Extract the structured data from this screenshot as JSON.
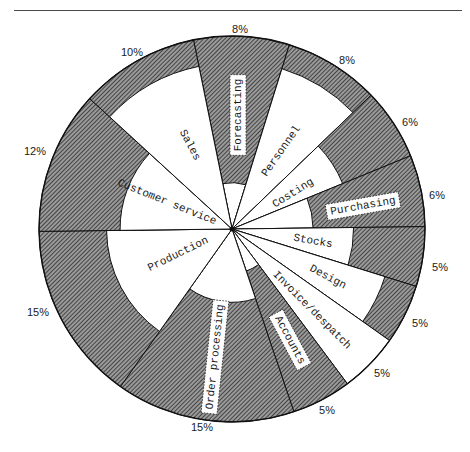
{
  "chart_data": {
    "type": "pie",
    "title": "",
    "categories": [
      "Forecasting",
      "Personnel",
      "Costing",
      "Purchasing",
      "Stocks",
      "Design",
      "Invoice/despatch",
      "Accounts",
      "Order processing",
      "Production",
      "Customer service",
      "Sales"
    ],
    "values": [
      8,
      8,
      6,
      6,
      5,
      5,
      5,
      5,
      15,
      15,
      12,
      10
    ],
    "value_labels": [
      "8%",
      "8%",
      "6%",
      "6%",
      "5%",
      "5%",
      "5%",
      "5%",
      "15%",
      "15%",
      "12%",
      "10%"
    ],
    "inner_white_ratio": [
      0.24,
      0.87,
      0.62,
      0.42,
      0.63,
      0.83,
      1.0,
      0.23,
      0.38,
      0.65,
      0.58,
      0.86
    ],
    "start_angle_deg": -11.5,
    "direction": "clockwise",
    "legend": "none",
    "grid": false,
    "colors": {
      "hatch": "#3c3c3c",
      "white": "#ffffff",
      "line": "#111111"
    }
  },
  "label_layout": {
    "cx": 232,
    "cy": 229,
    "r": 193,
    "segment_labels": [
      {
        "x": 238,
        "y": 115,
        "rot": -90,
        "boxed": true
      },
      {
        "x": 281,
        "y": 151,
        "rot": -55,
        "boxed": false
      },
      {
        "x": 293,
        "y": 193,
        "rot": -32,
        "boxed": false
      },
      {
        "x": 363,
        "y": 206,
        "rot": -10,
        "boxed": true
      },
      {
        "x": 313,
        "y": 241,
        "rot": 10,
        "boxed": false
      },
      {
        "x": 328,
        "y": 277,
        "rot": 28,
        "boxed": false
      },
      {
        "x": 312,
        "y": 310,
        "rot": 45,
        "boxed": false
      },
      {
        "x": 290,
        "y": 340,
        "rot": 62,
        "boxed": true
      },
      {
        "x": 215,
        "y": 357,
        "rot": -84,
        "boxed": true
      },
      {
        "x": 178,
        "y": 254,
        "rot": -26,
        "boxed": false
      },
      {
        "x": 167,
        "y": 202,
        "rot": 22,
        "boxed": false
      },
      {
        "x": 190,
        "y": 145,
        "rot": 62,
        "boxed": false
      }
    ],
    "pct_labels": [
      {
        "x": 240,
        "y": 33
      },
      {
        "x": 347,
        "y": 64
      },
      {
        "x": 410,
        "y": 126
      },
      {
        "x": 437,
        "y": 199
      },
      {
        "x": 440,
        "y": 271
      },
      {
        "x": 420,
        "y": 327
      },
      {
        "x": 382,
        "y": 377
      },
      {
        "x": 327,
        "y": 414
      },
      {
        "x": 202,
        "y": 431
      },
      {
        "x": 38,
        "y": 316
      },
      {
        "x": 35,
        "y": 155
      },
      {
        "x": 132,
        "y": 56
      }
    ]
  }
}
